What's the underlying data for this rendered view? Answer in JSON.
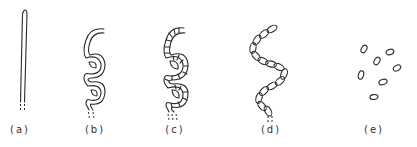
{
  "figure": {
    "panels": [
      {
        "id": "a",
        "label": "(a)",
        "shape": "straight-rod",
        "label_x": 20
      },
      {
        "id": "b",
        "label": "(b)",
        "shape": "coiled-filament",
        "label_x": 95
      },
      {
        "id": "c",
        "label": "(c)",
        "shape": "segmented-coiled-filament",
        "label_x": 175
      },
      {
        "id": "d",
        "label": "(d)",
        "shape": "chain-of-ovals",
        "label_x": 271
      },
      {
        "id": "e",
        "label": "(e)",
        "shape": "scattered-ovals",
        "label_x": 374
      }
    ],
    "colors": {
      "stroke": "#2a2a2a",
      "background": "#ffffff"
    }
  }
}
